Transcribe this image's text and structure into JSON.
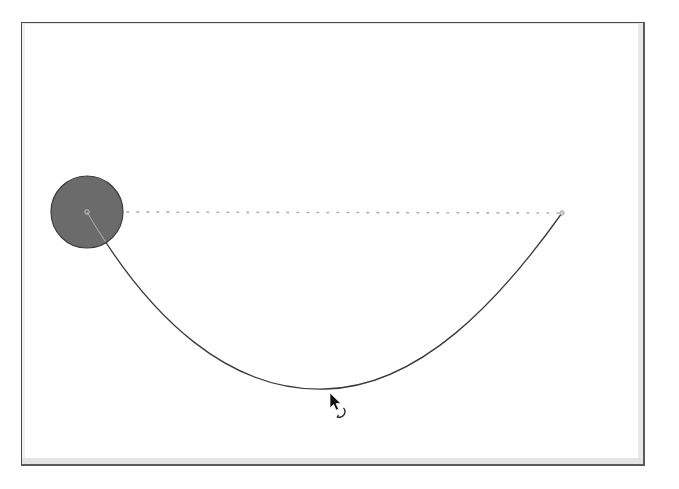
{
  "diagram": {
    "frame": {
      "x": 21,
      "y": 22,
      "width": 624,
      "height": 444
    },
    "bob": {
      "cx": 87,
      "cy": 212,
      "r": 36,
      "fill": "#6b6b6b",
      "stroke": "#3d3d3d"
    },
    "pivot_marker": {
      "cx": 87,
      "cy": 212,
      "r": 2.2
    },
    "anchor_point": {
      "cx": 562,
      "cy": 213,
      "r": 2.2
    },
    "guide_line": {
      "x1": 87,
      "y1": 212,
      "x2": 562,
      "y2": 213,
      "style": "dotted",
      "color": "#b0b0b0"
    },
    "curve": {
      "path": "M 87 212 C 150 320, 230 392, 325 389 C 420 387, 500 300, 562 213",
      "color": "#3a3a3a",
      "lowest_point": {
        "x": 325,
        "y": 389
      }
    },
    "cursor": {
      "x": 330,
      "y": 393,
      "type": "rotate-pointer"
    }
  }
}
